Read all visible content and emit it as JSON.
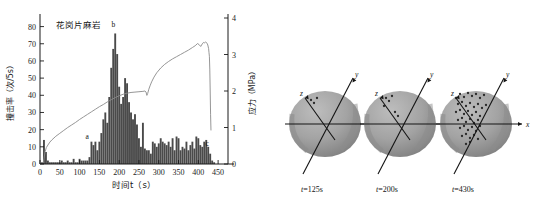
{
  "figure": {
    "panels": [
      "acoustic-emission-chart",
      "source-location-spheres"
    ]
  },
  "chart_data": {
    "type": "bar",
    "title": "花岗片麻岩",
    "xlabel": "时间t（s）",
    "ylabel": "撞击率（次/5s）",
    "y2label": "应力（MPa）",
    "xlim": [
      0,
      475
    ],
    "ylim": [
      0,
      85
    ],
    "y2lim": [
      0,
      4
    ],
    "xticks": [
      0,
      50,
      100,
      150,
      200,
      250,
      300,
      350,
      400,
      450
    ],
    "yticks": [
      0,
      10,
      20,
      30,
      40,
      50,
      60,
      70,
      80
    ],
    "y2ticks": [
      0,
      1,
      2,
      3,
      4
    ],
    "grid": false,
    "legend": "none",
    "bar_width_seconds": 5,
    "series": [
      {
        "name": "撞击率",
        "type": "bar",
        "x": [
          5,
          10,
          15,
          20,
          25,
          30,
          35,
          40,
          45,
          50,
          55,
          60,
          65,
          70,
          75,
          80,
          85,
          90,
          95,
          100,
          105,
          110,
          115,
          120,
          125,
          130,
          135,
          140,
          145,
          150,
          155,
          160,
          165,
          170,
          175,
          180,
          185,
          190,
          195,
          200,
          205,
          210,
          215,
          220,
          225,
          230,
          235,
          240,
          245,
          250,
          255,
          260,
          265,
          270,
          275,
          280,
          285,
          290,
          295,
          300,
          305,
          310,
          315,
          320,
          325,
          330,
          335,
          340,
          345,
          350,
          355,
          360,
          365,
          370,
          375,
          380,
          385,
          390,
          395,
          400,
          405,
          410,
          415,
          420,
          425,
          430,
          435,
          440
        ],
        "values": [
          1,
          14,
          7,
          2,
          1,
          1,
          1,
          1,
          1,
          1,
          2,
          1,
          1,
          2,
          1,
          1,
          3,
          1,
          1,
          3,
          2,
          2,
          2,
          2,
          4,
          13,
          11,
          13,
          8,
          13,
          18,
          26,
          30,
          24,
          39,
          56,
          67,
          76,
          64,
          45,
          35,
          39,
          50,
          47,
          36,
          30,
          26,
          29,
          23,
          15,
          10,
          24,
          9,
          8,
          8,
          6,
          13,
          12,
          10,
          12,
          15,
          13,
          12,
          11,
          13,
          10,
          15,
          8,
          16,
          15,
          8,
          10,
          9,
          13,
          8,
          11,
          13,
          9,
          16,
          15,
          11,
          10,
          13,
          14,
          10,
          6,
          2,
          1
        ]
      },
      {
        "name": "应力",
        "type": "line",
        "axis": "y2",
        "x": [
          8,
          10,
          13,
          16,
          20,
          25,
          30,
          40,
          50,
          60,
          70,
          80,
          90,
          100,
          110,
          120,
          130,
          140,
          150,
          160,
          170,
          180,
          190,
          200,
          210,
          220,
          230,
          240,
          250,
          260,
          265,
          268,
          270,
          272,
          275,
          278,
          282,
          288,
          295,
          305,
          315,
          325,
          335,
          345,
          355,
          365,
          375,
          385,
          392,
          398,
          402,
          406,
          410,
          413,
          416,
          418,
          420,
          422,
          424,
          426,
          427,
          428,
          429,
          430,
          431,
          432
        ],
        "values": [
          0.02,
          0.15,
          0.34,
          0.45,
          0.52,
          0.6,
          0.66,
          0.76,
          0.84,
          0.92,
          1.0,
          1.07,
          1.14,
          1.22,
          1.29,
          1.36,
          1.43,
          1.5,
          1.57,
          1.63,
          1.7,
          1.76,
          1.82,
          1.87,
          1.91,
          1.94,
          1.96,
          1.97,
          1.98,
          1.99,
          2.0,
          1.97,
          1.88,
          1.93,
          2.05,
          2.14,
          2.25,
          2.38,
          2.5,
          2.63,
          2.73,
          2.81,
          2.88,
          2.94,
          3.0,
          3.06,
          3.12,
          3.19,
          3.24,
          3.3,
          3.27,
          3.22,
          3.29,
          3.33,
          3.32,
          3.34,
          3.33,
          3.31,
          3.26,
          3.16,
          3.05,
          2.95,
          2.6,
          2.0,
          1.35,
          0.92
        ]
      }
    ],
    "annotations": [
      {
        "label": "a",
        "x": 122,
        "y": 13
      },
      {
        "label": "b",
        "x": 188,
        "y": 78
      },
      {
        "label": "c",
        "x": 425,
        "y": 9
      }
    ]
  },
  "spheres": {
    "items": [
      {
        "caption": "t=125s",
        "axes": [
          {
            "name": "x"
          },
          {
            "name": "y"
          },
          {
            "name": "z"
          }
        ],
        "event_count": 3
      },
      {
        "caption": "t=200s",
        "axes": [
          {
            "name": "x"
          },
          {
            "name": "y"
          },
          {
            "name": "z"
          }
        ],
        "event_count": 6
      },
      {
        "caption": "t=430s",
        "axes": [
          {
            "name": "x"
          },
          {
            "name": "y"
          },
          {
            "name": "z"
          }
        ],
        "event_count": 42
      }
    ]
  },
  "colors": {
    "bar": "#4a4a4a",
    "curve": "#8a8a8a",
    "axis": "#1a1a1a",
    "sphere_fill": "#9a9a9a",
    "sphere_shade": "#7d7d7d",
    "event_dot": "#2a2a2a"
  }
}
